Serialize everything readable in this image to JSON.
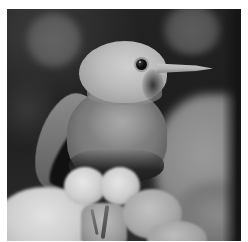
{
  "image": {
    "description": "Grayscale close-up photograph of a small songbird perched in a person's hand, dark blurred background with bokeh circles",
    "color_mode": "grayscale",
    "subjects": [
      {
        "name": "bird",
        "parts": [
          "head",
          "eye",
          "beak",
          "wing",
          "body",
          "feet"
        ]
      },
      {
        "name": "holding-hand",
        "parts": [
          "palm",
          "fingers"
        ]
      },
      {
        "name": "background-hand",
        "state": "blurred"
      }
    ],
    "border_color": "#ffffff",
    "palette": {
      "background_dark": "#1e1e1e",
      "bokeh": "#5e5e5e",
      "bird_head": "#c4c4c4",
      "bird_body": "#7e7e7e",
      "eye": "#080808",
      "beak": "#bdbdbd",
      "hand_highlight": "#e4e4e4"
    }
  }
}
